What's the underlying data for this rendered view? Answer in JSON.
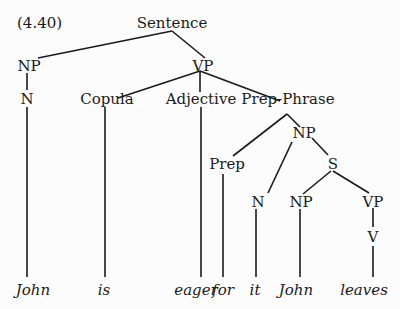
{
  "example_number": "(4.40)",
  "nodes": {
    "sentence": "Sentence",
    "np1": "NP",
    "vp1": "VP",
    "n1": "N",
    "copula": "Copula",
    "adjective": "Adjective",
    "prep_phrase": "Prep-Phrase",
    "np2": "NP",
    "prep": "Prep",
    "s": "S",
    "n2": "N",
    "np3": "NP",
    "vp2": "VP",
    "v": "V"
  },
  "leaves": {
    "john1": "John",
    "is": "is",
    "eager": "eager",
    "for": "for",
    "it": "it",
    "john2": "John",
    "leaves": "leaves"
  },
  "colors": {
    "line": "#1a1a1a",
    "background": "#fcfcfc"
  }
}
